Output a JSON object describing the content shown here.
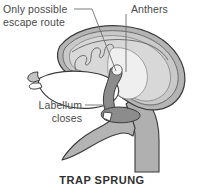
{
  "figure": {
    "caption": "TRAP SPRUNG",
    "background_color": "#ffffff"
  },
  "labels": {
    "escape_route": {
      "line1": "Only possible",
      "line2": "escape route"
    },
    "anthers": {
      "line1": "Anthers"
    },
    "labellum": {
      "line1": "Labellum",
      "line2": "closes"
    }
  },
  "colors": {
    "text": "#4a4a4a",
    "caption_text": "#2f2f2f",
    "outline": "#3a3a3a",
    "leader_line": "#6e6e6e",
    "hood_outer": "#b4b4b4",
    "hood_mid": "#c9c9c9",
    "hood_inner": "#d8d8d8",
    "chamber_fill": "#ffffff",
    "column_dark": "#8c8c8c",
    "stem_fill": "#b0b0b0",
    "lip_fill": "#b4b4b4"
  }
}
